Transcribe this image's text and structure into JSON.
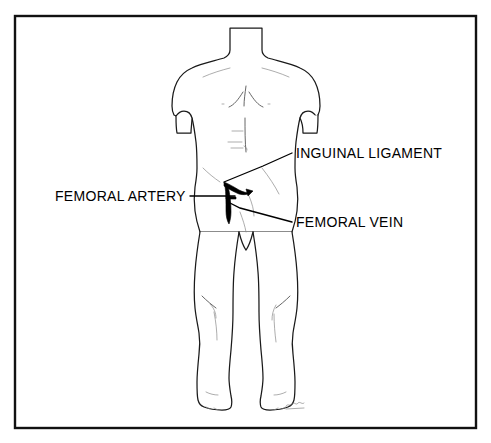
{
  "figure": {
    "background_color": "#ffffff",
    "frame": {
      "name": "diagram-border",
      "color": "#111111",
      "x": 15,
      "y": 16,
      "width": 461,
      "height": 412
    },
    "line_color": "#1a1a1a",
    "detail_color": "#4a4a4a"
  },
  "labels": [
    {
      "id": "inguinal-ligament",
      "text": "INGUINAL LIGAMENT",
      "color": "#000000",
      "text_x": 296,
      "text_y": 158,
      "anchor": "start",
      "leader": "M 292 153 L 263 166 L 224 182"
    },
    {
      "id": "femoral-artery",
      "text": "FEMORAL ARTERY",
      "color": "#000000",
      "text_x": 55,
      "text_y": 201,
      "anchor": "start",
      "leader": "M 190 196 L 235 196"
    },
    {
      "id": "femoral-vein",
      "text": "FEMORAL VEIN",
      "color": "#000000",
      "text_x": 296,
      "text_y": 227,
      "anchor": "start",
      "leader": "M 292 222 L 240 208 L 228 202"
    }
  ],
  "annotations": {
    "artery_stroke": "thick dark diagonal stroke marking the femoral artery below the inguinal ligament",
    "vein_stroke": "vertical dark stroke descending from the artery marking the femoral vein",
    "signature": "illegible artist signature near right foot"
  }
}
